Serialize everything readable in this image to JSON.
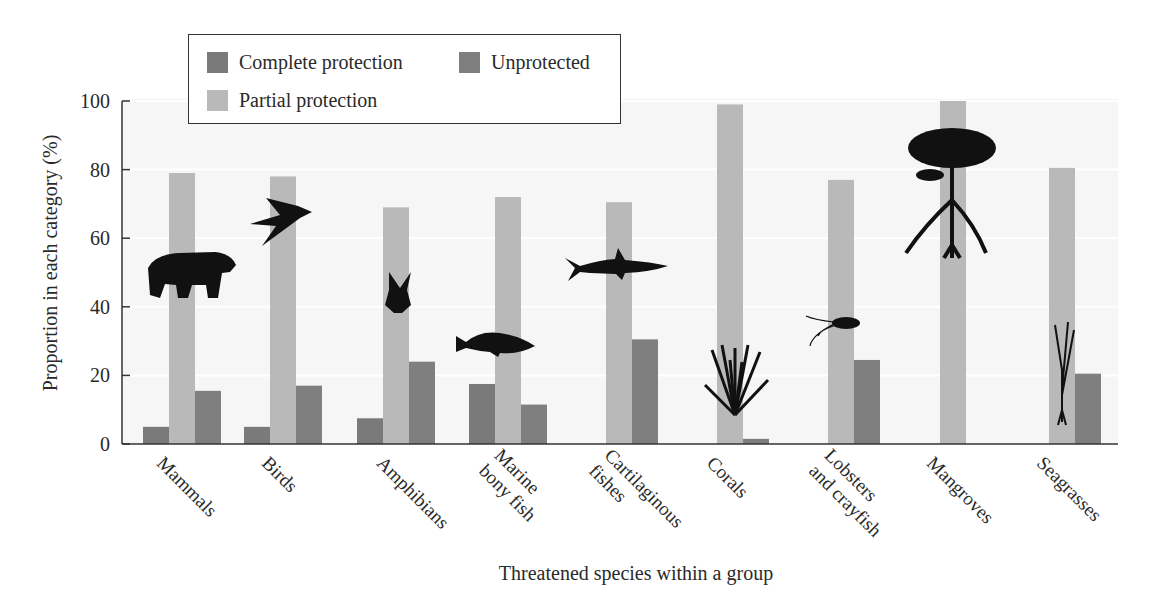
{
  "chart_data": {
    "type": "bar",
    "title": "",
    "xlabel": "Threatened species within a group",
    "ylabel": "Proportion in each category (%)",
    "ylim": [
      0,
      100
    ],
    "yticks": [
      0,
      20,
      40,
      60,
      80,
      100
    ],
    "grid": true,
    "legend_position": "top-left (boxed)",
    "categories": [
      "Mammals",
      "Birds",
      "Amphibians",
      "Marine bony fish",
      "Cartilaginous fishes",
      "Corals",
      "Lobsters and crayfish",
      "Mangroves",
      "Seagrasses"
    ],
    "category_label_lines": [
      [
        "Mammals"
      ],
      [
        "Birds"
      ],
      [
        "Amphibians"
      ],
      [
        "Marine",
        "bony fish"
      ],
      [
        "Cartilaginous",
        "fishes"
      ],
      [
        "Corals"
      ],
      [
        "Lobsters",
        "and crayfish"
      ],
      [
        "Mangroves"
      ],
      [
        "Seagrasses"
      ]
    ],
    "series": [
      {
        "name": "Complete protection",
        "color": "#7a7a7a",
        "values": [
          5,
          5,
          7.5,
          17.5,
          0,
          0,
          0,
          0,
          0
        ]
      },
      {
        "name": "Partial protection",
        "color": "#b9b9b9",
        "values": [
          79,
          78,
          69,
          72,
          70.5,
          99,
          77,
          100,
          80.5
        ]
      },
      {
        "name": "Unprotected",
        "color": "#7f7f7f",
        "values": [
          15.5,
          17,
          24,
          11.5,
          30.5,
          1.5,
          24.5,
          0,
          20.5
        ]
      }
    ],
    "icons": [
      "bear-silhouette",
      "swallow-silhouette",
      "frog-silhouette",
      "fish-silhouette",
      "shark-silhouette",
      "coral-silhouette",
      "lobster-silhouette",
      "mangrove-tree-silhouette",
      "seagrass-silhouette"
    ]
  },
  "legend": {
    "items": [
      {
        "label": "Complete protection",
        "color": "#7a7a7a"
      },
      {
        "label": "Unprotected",
        "color": "#7f7f7f"
      },
      {
        "label": "Partial protection",
        "color": "#b9b9b9"
      }
    ]
  },
  "colors": {
    "plot_background": "#f6f6f6",
    "gridline": "#ffffff",
    "axis": "#333333"
  }
}
